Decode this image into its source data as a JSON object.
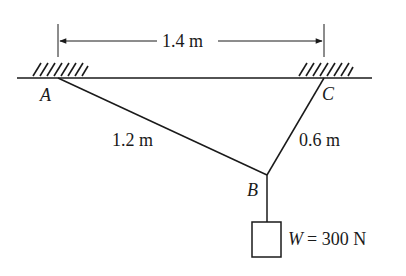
{
  "diagram": {
    "type": "statics-cable-system",
    "dimension_top": "1.4 m",
    "points": {
      "A": {
        "label": "A",
        "x": 58,
        "y": 78
      },
      "C": {
        "label": "C",
        "x": 324,
        "y": 78
      },
      "B": {
        "label": "B",
        "x": 267,
        "y": 175
      }
    },
    "members": [
      {
        "from": "A",
        "to": "B",
        "length_label": "1.2 m"
      },
      {
        "from": "C",
        "to": "B",
        "length_label": "0.6 m"
      }
    ],
    "load": {
      "symbol": "W",
      "equals": "= 300 N",
      "full": "W = 300 N"
    },
    "colors": {
      "ink": "#1a1a1a",
      "background": "#ffffff"
    }
  }
}
